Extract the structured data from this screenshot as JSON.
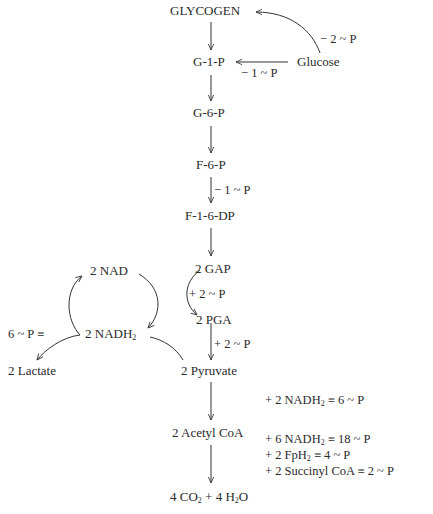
{
  "nodes": {
    "glycogen": "GLYCOGEN",
    "g1p": "G-1-P",
    "glucose": "Glucose",
    "g6p": "G-6-P",
    "f6p": "F-6-P",
    "f16dp": "F-1-6-DP",
    "gap": "2 GAP",
    "pga": "2 PGA",
    "nad": "2 NAD",
    "nadh2": "2 NADH",
    "nadh2_sub": "2",
    "lactate": "2 Lactate",
    "pyruvate": "2 Pyruvate",
    "acetyl_coa": "2 Acetyl  CoA",
    "final_co2_a": "4 CO",
    "final_co2_sub": "2",
    "final_h2o_a": " + 4 H",
    "final_h2o_sub": "2",
    "final_h2o_b": "O"
  },
  "edge_labels": {
    "glucose_to_glycogen": "− 2 ~ P",
    "glucose_to_g1p": "− 1 ~ P",
    "f6p_to_f16dp": "− 1 ~ P",
    "gap_to_pga": "+ 2 ~ P",
    "pga_to_pyruvate": "+ 2 ~ P",
    "nadh_equiv": "6 ~ P ≡"
  },
  "yields": {
    "pyruvate_to_acetyl": {
      "pre": "+ 2 NADH",
      "sub": "2",
      "post": " ≡ 6 ~ P"
    },
    "acetyl_line1": {
      "pre": "+ 6 NADH",
      "sub": "2",
      "post": " ≡ 18 ~ P"
    },
    "acetyl_line2": {
      "pre": "+ 2 FpH",
      "sub": "2",
      "post": " ≡ 4 ~ P"
    },
    "acetyl_line3": {
      "pre": "+ 2 Succinyl CoA ≡ 2 ~ P",
      "sub": "",
      "post": ""
    }
  }
}
